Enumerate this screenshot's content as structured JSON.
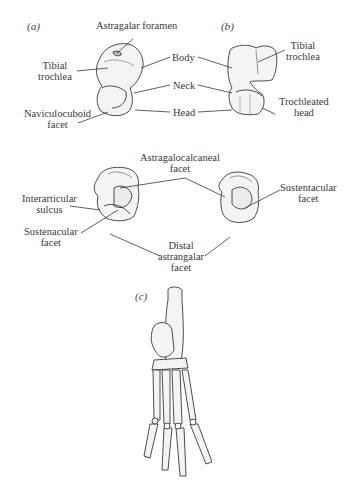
{
  "figure": {
    "panels": [
      {
        "id": "a",
        "label": "(a)"
      },
      {
        "id": "b",
        "label": "(b)"
      },
      {
        "id": "c",
        "label": "(c)"
      }
    ],
    "panel_a": {
      "labels": {
        "astragalar_foramen": "Astragalar  foramen",
        "tibial_trochlea_1": "Tibial",
        "tibial_trochlea_2": "trochlea",
        "naviculocuboid_1": "Naviculocuboid",
        "naviculocuboid_2": "facet",
        "body": "Body",
        "neck": "Neck",
        "head": "Head"
      }
    },
    "panel_b": {
      "labels": {
        "tibial_trochlea_1": "Tibial",
        "tibial_trochlea_2": "trochlea",
        "trochleated_head_1": "Trochleated",
        "trochleated_head_2": "head"
      }
    },
    "middle": {
      "labels": {
        "astragalocalcaneal_1": "Astragalocalcaneal",
        "astragalocalcaneal_2": "facet",
        "interarticular_1": "Interarticular",
        "interarticular_2": "sulcus",
        "sustenacular_1": "Sustenacular",
        "sustenacular_2": "facet",
        "distal_1": "Distal",
        "distal_2": "astrangalar",
        "distal_3": "facet",
        "sustentacular_1": "Sustentacular",
        "sustentacular_2": "facet"
      }
    },
    "colors": {
      "ink": "#3a3a3a",
      "bone_fill": "#f4f4f2",
      "shade": "#9a9a9a"
    }
  }
}
